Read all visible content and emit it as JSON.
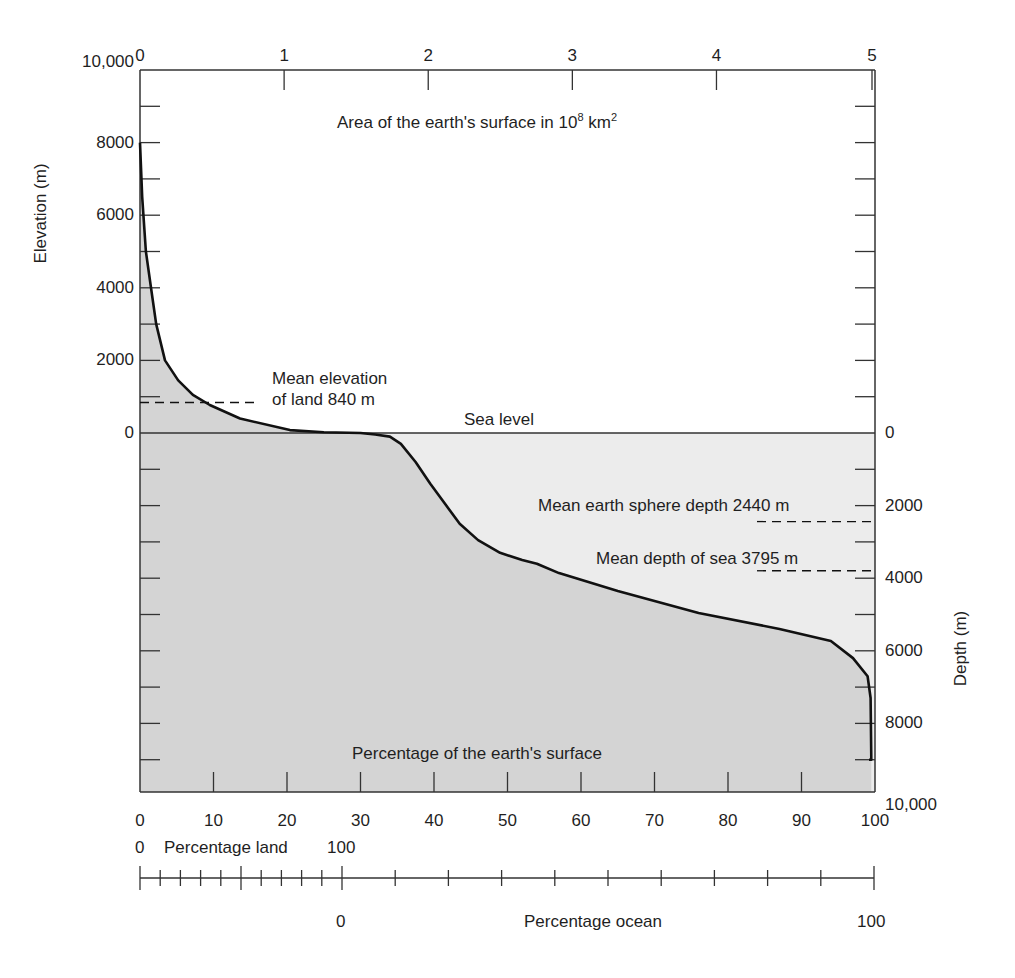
{
  "chart_data": {
    "type": "area",
    "xlabel": "Percentage of the earth's surface",
    "x2label": "Area of the earth's surface in 10^8 km^2",
    "ylabel": "Elevation (m)",
    "y2label": "Depth (m)",
    "xlim": [
      0,
      100
    ],
    "x2lim": [
      0,
      5
    ],
    "ylim": [
      -10000,
      10000
    ],
    "grid": false,
    "x_ticks": [
      "0",
      "10",
      "20",
      "30",
      "40",
      "50",
      "60",
      "70",
      "80",
      "90",
      "100"
    ],
    "x2_ticks": [
      "0",
      "1",
      "2",
      "3",
      "4",
      "5"
    ],
    "y_ticks_left": [
      "10,000",
      "8000",
      "6000",
      "4000",
      "2000",
      "0"
    ],
    "y_ticks_right": [
      "0",
      "2000",
      "4000",
      "6000",
      "8000",
      "10,000"
    ],
    "series": [
      {
        "name": "Hypsographic curve",
        "x": [
          0,
          0.3,
          0.8,
          1.5,
          2.2,
          3.4,
          5.2,
          7.2,
          9.5,
          13.6,
          20.4,
          25,
          30,
          32,
          34,
          35.5,
          37.5,
          39.5,
          41.5,
          43.5,
          46,
          49,
          52,
          54,
          57,
          65,
          76,
          87,
          94,
          97,
          99,
          99.4,
          99.5
        ],
        "y": [
          8000,
          6500,
          5000,
          4000,
          3000,
          2000,
          1450,
          1050,
          770,
          400,
          80,
          20,
          0,
          -40,
          -100,
          -300,
          -800,
          -1400,
          -1950,
          -2500,
          -2950,
          -3300,
          -3500,
          -3600,
          -3860,
          -4350,
          -4960,
          -5400,
          -5730,
          -6200,
          -6700,
          -7300,
          -9000
        ]
      }
    ],
    "annotations": [
      {
        "text": "Mean elevation of land 840 m",
        "value": 840
      },
      {
        "text": "Sea level",
        "value": 0
      },
      {
        "text": "Mean earth sphere depth 2440 m",
        "value": -2440
      },
      {
        "text": "Mean depth of sea 3795 m",
        "value": -3795
      }
    ],
    "secondary_scales": {
      "land": {
        "label": "Percentage land",
        "min": "0",
        "max": "100"
      },
      "ocean": {
        "label": "Percentage ocean",
        "min": "0",
        "max": "100"
      }
    }
  },
  "labels": {
    "top_axis_title": "Area of the earth's surface in 10",
    "top_axis_exp": "8",
    "top_axis_unit": " km",
    "top_axis_unit_exp": "2",
    "left_axis_title": "Elevation (m)",
    "right_axis_title": "Depth (m)",
    "bottom_inner_title": "Percentage of the earth's surface",
    "sea_level": "Sea level",
    "mean_elevation_line1": "Mean elevation",
    "mean_elevation_line2": "of land 840 m",
    "mean_sphere_depth": "Mean earth sphere depth 2440 m",
    "mean_sea_depth": "Mean depth of sea 3795 m",
    "land_zero": "0",
    "land_label": "Percentage land",
    "land_hundred": "100",
    "ocean_zero": "0",
    "ocean_label": "Percentage ocean",
    "ocean_hundred": "100"
  },
  "colors": {
    "land_fill": "#d6d6d6",
    "ocean_fill": "#ececec",
    "below_curve_fill": "#d4d4d4",
    "line": "#111111",
    "axis": "#333333"
  }
}
